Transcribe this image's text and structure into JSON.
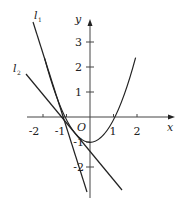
{
  "figure": {
    "type": "function-graph",
    "curve": "parabola",
    "curve_equation_implied": "y = x^2 - 1",
    "axes": {
      "x_label": "x",
      "y_label": "y",
      "origin_label": "O",
      "x_ticks": [
        "-2",
        "-1",
        "1",
        "2"
      ],
      "y_ticks": [
        "3",
        "2",
        "1",
        "-1",
        "-2"
      ]
    },
    "lines": [
      {
        "label": "l",
        "subscript": "1"
      },
      {
        "label": "l",
        "subscript": "2"
      }
    ],
    "colors": {
      "stroke": "#222222",
      "background": "#ffffff"
    }
  }
}
